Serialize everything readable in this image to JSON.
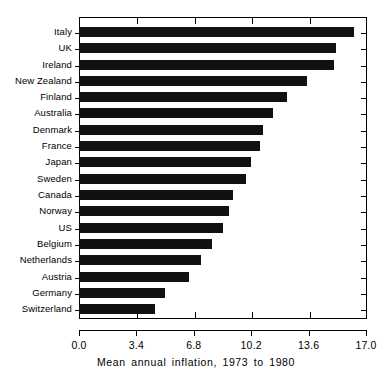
{
  "chart_data": {
    "type": "bar",
    "orientation": "horizontal",
    "title": "",
    "xlabel": "Mean annual inflation, 1973 to 1980",
    "ylabel": "",
    "xlim": [
      0.0,
      17.0
    ],
    "xticks": [
      "0.0",
      "3.4",
      "6.8",
      "10.2",
      "13.6",
      "17.0"
    ],
    "xtick_values": [
      0.0,
      3.4,
      6.8,
      10.2,
      13.6,
      17.0
    ],
    "grid": false,
    "legend": false,
    "bar_color": "#111111",
    "axis_color": "#000000",
    "background": "#ffffff",
    "categories": [
      "Italy",
      "UK",
      "Ireland",
      "New Zealand",
      "Finland",
      "Australia",
      "Denmark",
      "France",
      "Japan",
      "Sweden",
      "Canada",
      "Norway",
      "US",
      "Belgium",
      "Netherlands",
      "Austria",
      "Germany",
      "Switzerland"
    ],
    "values": [
      16.3,
      15.2,
      15.1,
      13.5,
      12.3,
      11.5,
      10.9,
      10.7,
      10.2,
      9.9,
      9.1,
      8.9,
      8.5,
      7.9,
      7.2,
      6.5,
      5.1,
      4.5
    ]
  }
}
